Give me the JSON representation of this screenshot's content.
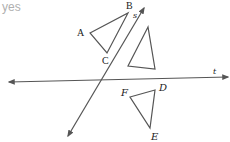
{
  "caption": "yes",
  "diagram": {
    "lines": [
      {
        "name": "s",
        "label": "s",
        "from": [
          68,
          136
        ],
        "to": [
          144,
          8
        ],
        "arrows": "both"
      },
      {
        "name": "t",
        "label": "t",
        "from": [
          9,
          82
        ],
        "to": [
          228,
          77
        ],
        "arrows": "both"
      }
    ],
    "triangles": [
      {
        "name": "ABC",
        "vertices": {
          "A": [
            90,
            33
          ],
          "B": [
            128,
            13
          ],
          "C": [
            107,
            53
          ]
        }
      },
      {
        "name": "unlabeled",
        "vertices": {
          "top": [
            148,
            27
          ],
          "bottom_left": [
            128,
            66
          ],
          "bottom_right": [
            155,
            69
          ]
        }
      },
      {
        "name": "DEF",
        "vertices": {
          "F": [
            130,
            97
          ],
          "D": [
            155,
            90
          ],
          "E": [
            150,
            128
          ]
        }
      }
    ],
    "labels": {
      "A": "A",
      "B": "B",
      "C": "C",
      "D": "D",
      "E": "E",
      "F": "F",
      "s": "s",
      "t": "t"
    },
    "stroke_color": "#555555"
  }
}
